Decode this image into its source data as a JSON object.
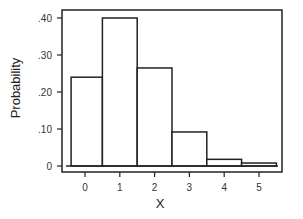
{
  "chart_data": {
    "type": "bar",
    "title": "",
    "xlabel": "X",
    "ylabel": "Probability",
    "categories": [
      "0",
      "1",
      "2",
      "3",
      "4",
      "5"
    ],
    "values": [
      0.24,
      0.4,
      0.265,
      0.092,
      0.018,
      0.008
    ],
    "ylim": [
      0,
      0.42
    ],
    "yticks": [
      {
        "value": 0,
        "label": "0"
      },
      {
        "value": 0.1,
        "label": ".10"
      },
      {
        "value": 0.2,
        "label": ".20"
      },
      {
        "value": 0.3,
        "label": ".30"
      },
      {
        "value": 0.4,
        "label": ".40"
      }
    ],
    "xticks": [
      "0",
      "1",
      "2",
      "3",
      "4",
      "5"
    ],
    "grid": false,
    "legend": null,
    "style": {
      "bar_fill": "#ffffff",
      "bar_stroke": "#222222",
      "frame_color": "#222222"
    }
  }
}
